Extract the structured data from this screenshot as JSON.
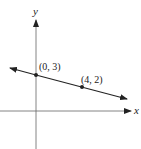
{
  "diagram": {
    "axes": {
      "x_label": "x",
      "y_label": "y"
    },
    "line": {
      "description": "line through two labeled points, arrows both ends"
    },
    "points": [
      {
        "label": "(0, 3)",
        "x": 0,
        "y": 3
      },
      {
        "label": "(4, 2)",
        "x": 4,
        "y": 2
      }
    ],
    "colors": {
      "ink": "#222222",
      "axis": "#555555",
      "background": "#ffffff"
    }
  }
}
